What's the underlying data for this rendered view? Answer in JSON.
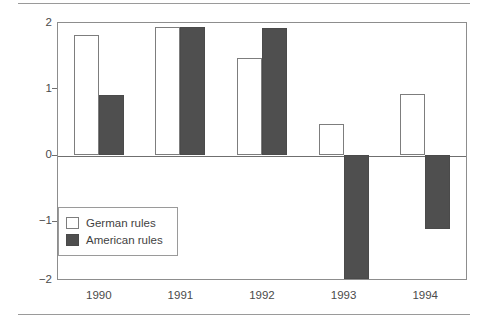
{
  "chart_data": {
    "type": "bar",
    "title": "",
    "subtitle": "",
    "xlabel": "",
    "ylabel": "",
    "categories": [
      "1990",
      "1991",
      "1992",
      "1993",
      "1994"
    ],
    "series": [
      {
        "name": "German rules",
        "values": [
          1.8,
          1.93,
          1.46,
          0.47,
          0.91
        ]
      },
      {
        "name": "American rules",
        "values": [
          0.9,
          1.93,
          1.91,
          -1.86,
          -1.12
        ]
      }
    ],
    "ylim": [
      -2,
      2
    ],
    "yticks": [
      2,
      1,
      0,
      -1,
      -2
    ],
    "ytick_labels": [
      "2",
      "1",
      "0",
      "−1",
      "−2"
    ],
    "grid": false,
    "legend_position": "inside-lower-left",
    "zero_line": true,
    "colors": {
      "german": "#ffffff",
      "german_edge": "#7d7d7d",
      "american": "#4f4f4f",
      "american_edge": "#4a4a4a",
      "frame": "#8d8d8d",
      "axis_text": "#4a4a4a",
      "rule": "#9a9a9a"
    }
  },
  "legend": {
    "entries": [
      {
        "label": "German rules",
        "style": "german"
      },
      {
        "label": "American rules",
        "style": "american"
      }
    ]
  }
}
